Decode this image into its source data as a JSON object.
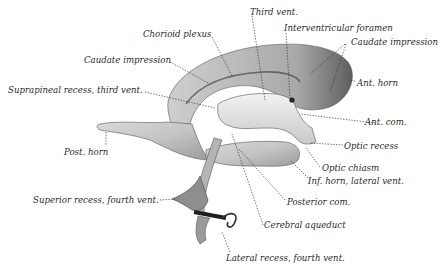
{
  "figure": {
    "colors": {
      "background": "#ffffff",
      "cast_light": "#e6e6e6",
      "cast_mid": "#bdbdbd",
      "cast_dark": "#6e6e6e",
      "text": "#2a2a2a"
    },
    "labels": [
      {
        "id": "chorioid-plexus",
        "text": "Chorioid plexus"
      },
      {
        "id": "third-vent",
        "text": "Third vent."
      },
      {
        "id": "interventricular-foramen",
        "text": "Interventricular foramen"
      },
      {
        "id": "caudate-impression-left",
        "text": "Caudate impression"
      },
      {
        "id": "caudate-impression-right",
        "text": "Caudate impression"
      },
      {
        "id": "suprapineal-recess",
        "text": "Suprapineal recess, third vent."
      },
      {
        "id": "ant-horn",
        "text": "Ant. horn"
      },
      {
        "id": "ant-com",
        "text": "Ant. com."
      },
      {
        "id": "post-horn",
        "text": "Post. horn"
      },
      {
        "id": "optic-recess",
        "text": "Optic recess"
      },
      {
        "id": "optic-chiasm",
        "text": "Optic chiasm"
      },
      {
        "id": "inf-horn",
        "text": "Inf. horn, lateral vent."
      },
      {
        "id": "superior-recess",
        "text": "Superior recess, fourth vent."
      },
      {
        "id": "posterior-com",
        "text": "Posterior com."
      },
      {
        "id": "cerebral-aqueduct",
        "text": "Cerebral aqueduct"
      },
      {
        "id": "lateral-recess",
        "text": "Lateral recess, fourth vent."
      }
    ]
  }
}
